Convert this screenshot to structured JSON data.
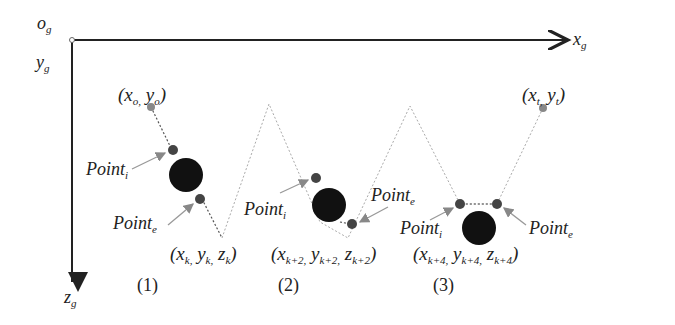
{
  "axes": {
    "origin": {
      "base": "o",
      "sub": "g"
    },
    "x": {
      "base": "x",
      "sub": "g"
    },
    "y": {
      "base": "y",
      "sub": "g"
    },
    "z": {
      "base": "z",
      "sub": "g"
    }
  },
  "points": {
    "start": {
      "text": "(x",
      "sub1": "o,",
      "mid": " y",
      "sub2": "o",
      "end": ")"
    },
    "target": {
      "text": "(x",
      "sub1": "t,",
      "mid": " y",
      "sub2": "t",
      "end": ")"
    }
  },
  "panels": [
    {
      "number": "(1)",
      "coord": {
        "x": "x",
        "xs": "k,",
        "y": " y",
        "ys": "k,",
        "z": " z",
        "zs": "k"
      },
      "point_i": {
        "base": "Point",
        "sub": "i"
      },
      "point_e": {
        "base": "Point",
        "sub": "e"
      }
    },
    {
      "number": "(2)",
      "coord": {
        "x": "x",
        "xs": "k+2,",
        "y": " y",
        "ys": "k+2,",
        "z": " z",
        "zs": "k+2"
      },
      "point_i": {
        "base": "Point",
        "sub": "i"
      },
      "point_e": {
        "base": "Point",
        "sub": "e"
      }
    },
    {
      "number": "(3)",
      "coord": {
        "x": "x",
        "xs": "k+4,",
        "y": " y",
        "ys": "k+4,",
        "z": " z",
        "zs": "k+4"
      },
      "point_i": {
        "base": "Point",
        "sub": "i"
      },
      "point_e": {
        "base": "Point",
        "sub": "e"
      }
    }
  ],
  "colors": {
    "axis": "#222222",
    "obstacle": "#111111",
    "point": "#444444",
    "path": "#999999",
    "arrow": "#888888"
  }
}
